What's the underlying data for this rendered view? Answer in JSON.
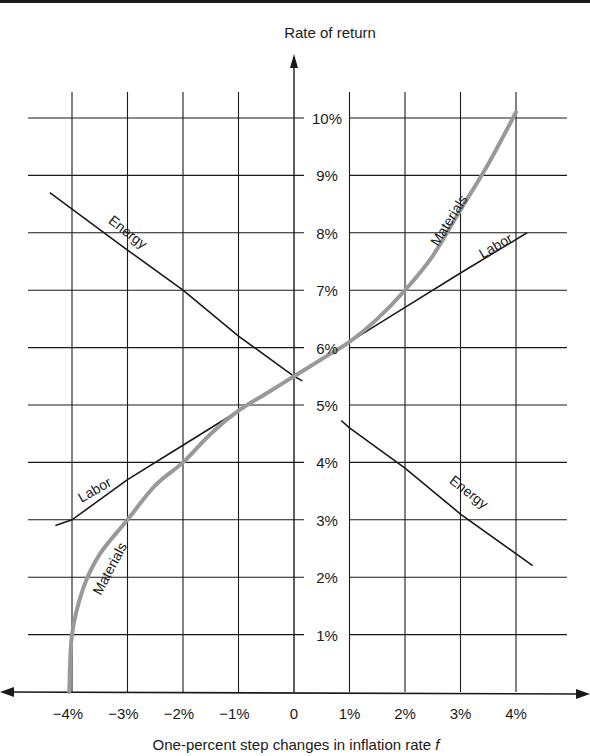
{
  "chart_data": {
    "type": "line",
    "title": "",
    "ylabel": "Rate of return",
    "xlabel": "One-percent step changes in inflation rate f",
    "xlabel_main": "One-percent step changes in inflation rate ",
    "xlabel_var": "f",
    "x_ticks": [
      -4,
      -3,
      -2,
      -1,
      0,
      1,
      2,
      3,
      4
    ],
    "x_tick_labels": [
      "−4%",
      "−3%",
      "−2%",
      "−1%",
      "0",
      "1%",
      "2%",
      "3%",
      "4%"
    ],
    "y_ticks": [
      1,
      2,
      3,
      4,
      5,
      6,
      7,
      8,
      9,
      10
    ],
    "y_tick_labels": [
      "1%",
      "2%",
      "3%",
      "4%",
      "5%",
      "6%",
      "7%",
      "8%",
      "9%",
      "10%"
    ],
    "xlim": [
      -4.4,
      4.5
    ],
    "ylim": [
      0,
      10.1
    ],
    "grid": true,
    "legend": "inline labels",
    "series": [
      {
        "name": "Energy",
        "color": "#1a1a1a",
        "style": "solid thin",
        "x": [
          -4.4,
          -3,
          -2,
          -1,
          0,
          1,
          2,
          3,
          4.3
        ],
        "y": [
          8.7,
          7.7,
          7.0,
          6.2,
          5.5,
          4.6,
          3.9,
          3.1,
          2.2
        ],
        "label_positions": [
          {
            "x": -3.2,
            "y": 8.0
          },
          {
            "x": 2.7,
            "y": 3.5
          }
        ]
      },
      {
        "name": "Labor",
        "color": "#1a1a1a",
        "style": "solid thin",
        "x": [
          -4.3,
          -4,
          -3,
          -2,
          -1,
          0,
          1,
          2,
          3,
          4.2
        ],
        "y": [
          2.9,
          3.0,
          3.7,
          4.3,
          4.9,
          5.5,
          6.1,
          6.7,
          7.3,
          8.0
        ],
        "label_positions": [
          {
            "x": -3.5,
            "y": 3.5
          },
          {
            "x": 3.6,
            "y": 7.7
          }
        ]
      },
      {
        "name": "Materials",
        "color": "#999999",
        "style": "thick gray curve",
        "x": [
          -4.05,
          -4.0,
          -3.8,
          -3.5,
          -3,
          -2.5,
          -2,
          -1.5,
          -1,
          -0.5,
          0,
          0.5,
          1,
          1.5,
          2,
          2.5,
          3,
          3.5,
          4.0
        ],
        "y": [
          0.0,
          1.0,
          1.8,
          2.4,
          3.0,
          3.6,
          4.0,
          4.5,
          4.9,
          5.2,
          5.5,
          5.8,
          6.1,
          6.5,
          7.0,
          7.6,
          8.4,
          9.2,
          10.1
        ],
        "label_positions": [
          {
            "x": -3.3,
            "y": 2.0
          },
          {
            "x": 2.8,
            "y": 8.5
          }
        ]
      }
    ]
  }
}
